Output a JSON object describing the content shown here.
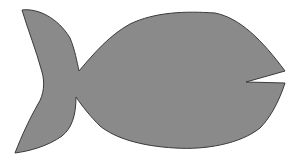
{
  "figure": {
    "colors": {
      "background": "#ffffff",
      "fill": "#8a8a8a",
      "outline": "#3a3a3a"
    },
    "parts": [
      "tail",
      "body",
      "mouth-notch"
    ]
  }
}
